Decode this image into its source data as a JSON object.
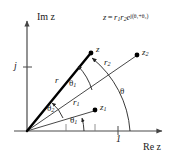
{
  "figure": {
    "title_formula": {
      "lhs": "z",
      "equals": "=",
      "rhs_mag1": "r",
      "rhs_mag1_sub": "1",
      "rhs_mag2": "r",
      "rhs_mag2_sub": "2",
      "rhs_exp_base": "e",
      "rhs_exponent": "j(θ₁+θ₂)"
    },
    "axes": {
      "imaginary_label": "Im z",
      "real_label": "Re z",
      "imaginary_tick_label": "j",
      "real_tick_label": "1"
    },
    "points": [
      {
        "name": "z",
        "label": "z",
        "sub": "",
        "x": 91,
        "y": 53
      },
      {
        "name": "z2",
        "label": "z",
        "sub": "2",
        "x": 137,
        "y": 55
      },
      {
        "name": "z1",
        "label": "z",
        "sub": "1",
        "x": 95,
        "y": 110
      }
    ],
    "magnitudes": [
      {
        "name": "r",
        "label": "r",
        "sub": "",
        "x": 55,
        "y": 80
      },
      {
        "name": "r2",
        "label": "r",
        "sub": "2",
        "x": 104,
        "y": 62
      },
      {
        "name": "r1",
        "label": "r",
        "sub": "1",
        "x": 73,
        "y": 102
      }
    ],
    "angles": [
      {
        "name": "theta1-upper",
        "label": "θ",
        "sub": "1",
        "x": 71,
        "y": 83
      },
      {
        "name": "theta",
        "label": "θ",
        "sub": "",
        "x": 122,
        "y": 91
      },
      {
        "name": "theta2",
        "label": "θ",
        "sub": "2",
        "x": 49,
        "y": 108
      },
      {
        "name": "theta1-lower",
        "label": "θ",
        "sub": "1",
        "x": 72,
        "y": 120
      }
    ],
    "colors": {
      "line": "#1a1a1a",
      "background": "#ffffff",
      "axis": "#555555",
      "bold_vector": "#000000"
    }
  }
}
